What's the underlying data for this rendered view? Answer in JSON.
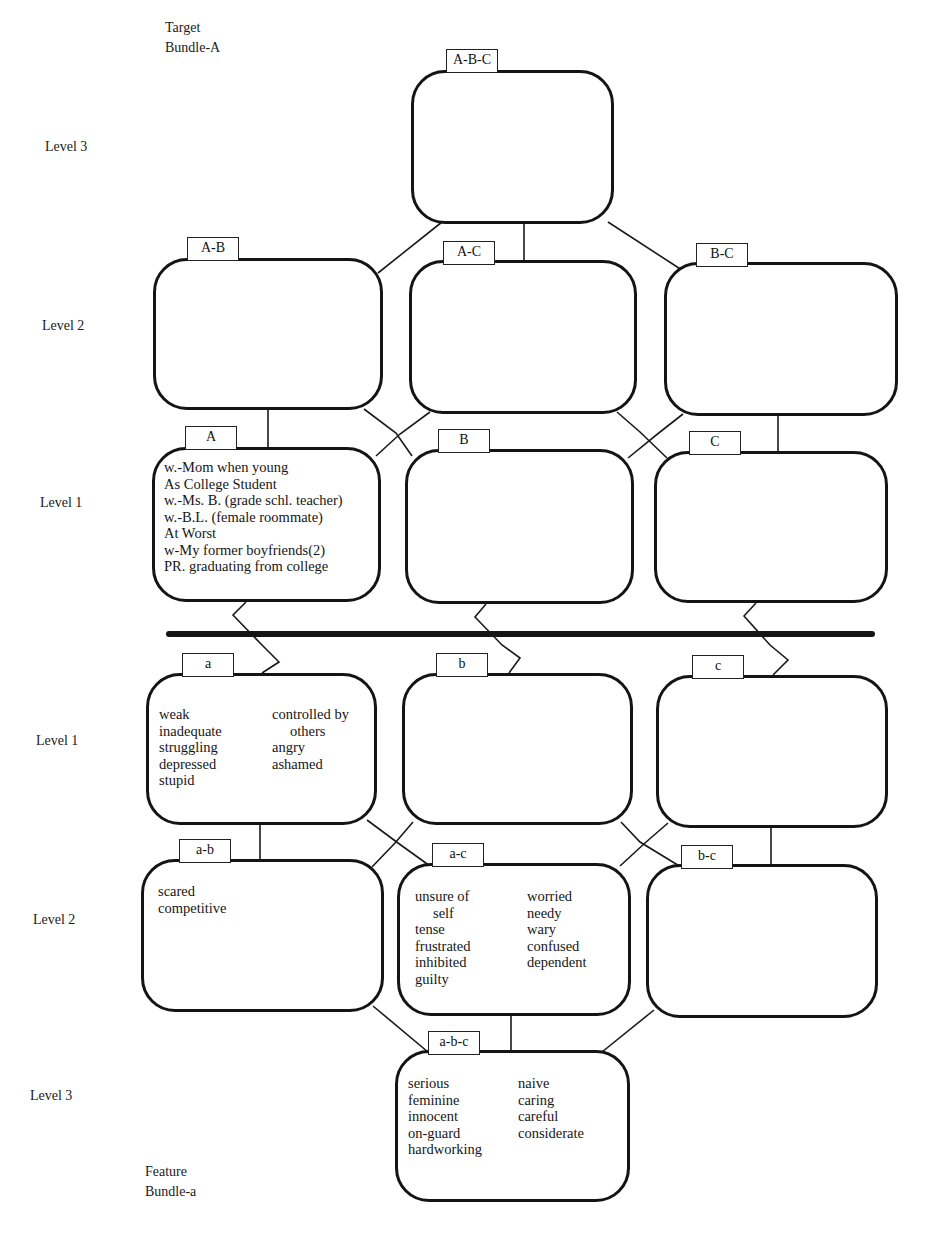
{
  "target_bundle": {
    "line1": "Target",
    "line2": "Bundle-A"
  },
  "feature_bundle": {
    "line1": "Feature",
    "line2": "Bundle-a"
  },
  "level_labels": {
    "upper": [
      "Level 3",
      "Level 2",
      "Level 1"
    ],
    "lower": [
      "Level 1",
      "Level 2",
      "Level 3"
    ]
  },
  "target_nodes": {
    "ABC": {
      "tab": "A-B-C",
      "items": []
    },
    "AB": {
      "tab": "A-B",
      "items": []
    },
    "AC": {
      "tab": "A-C",
      "items": []
    },
    "BC": {
      "tab": "B-C",
      "items": []
    },
    "A": {
      "tab": "A",
      "items": [
        "w.-Mom when young",
        "As College Student",
        "w.-Ms. B. (grade schl. teacher)",
        "w.-B.L. (female roommate)",
        "At Worst",
        "w-My former boyfriends(2)",
        "PR. graduating from college"
      ]
    },
    "B": {
      "tab": "B",
      "items": []
    },
    "C": {
      "tab": "C",
      "items": []
    }
  },
  "feature_nodes": {
    "a": {
      "tab": "a",
      "col1": [
        "weak",
        "inadequate",
        "struggling",
        "depressed",
        "stupid"
      ],
      "col2": [
        "controlled by",
        "others",
        "angry",
        "ashamed"
      ]
    },
    "b": {
      "tab": "b",
      "col1": [],
      "col2": []
    },
    "c": {
      "tab": "c",
      "col1": [],
      "col2": []
    },
    "ab": {
      "tab": "a-b",
      "col1": [
        "scared",
        "competitive"
      ],
      "col2": []
    },
    "ac": {
      "tab": "a-c",
      "col1": [
        "unsure of",
        "self",
        "tense",
        "frustrated",
        "inhibited",
        "guilty"
      ],
      "col2": [
        "worried",
        "needy",
        "wary",
        "confused",
        "dependent"
      ]
    },
    "bc": {
      "tab": "b-c",
      "col1": [],
      "col2": []
    },
    "abc": {
      "tab": "a-b-c",
      "col1": [
        "serious",
        "feminine",
        "innocent",
        "on-guard",
        "hardworking"
      ],
      "col2": [
        "naive",
        "caring",
        "careful",
        "considerate"
      ]
    }
  },
  "colors": {
    "ink": "#141414",
    "background": "#ffffff"
  }
}
